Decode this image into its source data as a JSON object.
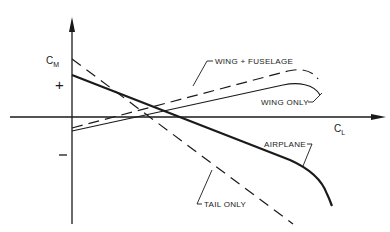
{
  "diagram": {
    "axes": {
      "y_label_main": "C",
      "y_label_sub": "M",
      "x_label_main": "C",
      "x_label_sub": "L",
      "plus_sign": "+",
      "minus_sign": "−"
    },
    "curves": [
      {
        "name": "Wing + Fuselage",
        "label": "WING + FUSELAGE",
        "style": "dashed"
      },
      {
        "name": "Wing only",
        "label": "WING ONLY",
        "style": "solid-thin"
      },
      {
        "name": "Airplane",
        "label": "AIRPLANE",
        "style": "solid-thick"
      },
      {
        "name": "Tail only",
        "label": "TAIL ONLY",
        "style": "dashed"
      }
    ],
    "colors": {
      "ink": "#1a1a1a",
      "background": "#ffffff"
    }
  }
}
